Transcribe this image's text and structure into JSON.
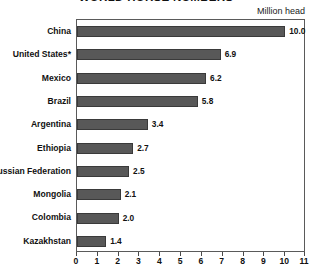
{
  "chart_data": {
    "type": "bar",
    "orientation": "horizontal",
    "title": "WORLD HORSE NUMBERS",
    "unit_caption": "Million head",
    "xlabel": "",
    "ylabel": "",
    "xlim": [
      0,
      11
    ],
    "xticks": [
      0,
      1,
      2,
      3,
      4,
      5,
      6,
      7,
      8,
      9,
      10,
      11
    ],
    "xtick_labels": [
      "0",
      "1",
      "2",
      "3",
      "4",
      "5",
      "6",
      "7",
      "8",
      "9",
      "10",
      "11"
    ],
    "grid": false,
    "legend": null,
    "categories": [
      "China",
      "United States*",
      "Mexico",
      "Brazil",
      "Argentina",
      "Ethiopia",
      "Russian Federation",
      "Mongolia",
      "Colombia",
      "Kazakhstan"
    ],
    "values": [
      10.0,
      6.9,
      6.2,
      5.8,
      3.4,
      2.7,
      2.5,
      2.1,
      2.0,
      1.4
    ],
    "value_labels": [
      "10.0",
      "6.9",
      "6.2",
      "5.8",
      "3.4",
      "2.7",
      "2.5",
      "2.1",
      "2.0",
      "1.4"
    ],
    "bar_color": "#585858",
    "bar_edge_color": "#3a3a3a",
    "frame_color": "#5a5a5a",
    "text_color": "#111111",
    "background_color": "#ffffff"
  }
}
